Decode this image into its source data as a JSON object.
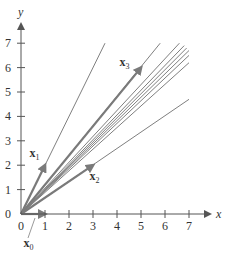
{
  "chart_data": {
    "type": "line",
    "title": "",
    "xlabel": "x",
    "ylabel": "y",
    "xlim": [
      0,
      7.5
    ],
    "ylim": [
      0,
      7.5
    ],
    "grid": false,
    "x_ticks": [
      0,
      1,
      2,
      3,
      4,
      5,
      6,
      7
    ],
    "y_ticks": [
      0,
      1,
      2,
      3,
      4,
      5,
      6,
      7
    ],
    "vectors": [
      {
        "name": "x0",
        "from": [
          0,
          0
        ],
        "to": [
          1,
          0
        ]
      },
      {
        "name": "x1",
        "from": [
          0,
          0
        ],
        "to": [
          1,
          2
        ]
      },
      {
        "name": "x2",
        "from": [
          0,
          0
        ],
        "to": [
          3,
          2
        ]
      },
      {
        "name": "x3",
        "from": [
          0,
          0
        ],
        "to": [
          5,
          6
        ]
      }
    ],
    "rays": [
      {
        "to": [
          3.5,
          7.0
        ]
      },
      {
        "to": [
          5.8,
          7.0
        ]
      },
      {
        "to": [
          6.6,
          7.0
        ]
      },
      {
        "to": [
          6.8,
          6.9
        ]
      },
      {
        "to": [
          6.9,
          6.8
        ]
      },
      {
        "to": [
          7.0,
          6.7
        ]
      },
      {
        "to": [
          7.0,
          6.5
        ]
      },
      {
        "to": [
          7.0,
          6.2
        ]
      },
      {
        "to": [
          7.0,
          4.7
        ]
      }
    ],
    "labels": [
      {
        "text": "x",
        "sub": "0",
        "at": [
          0.1,
          -1.35
        ]
      },
      {
        "text": "x",
        "sub": "1",
        "at": [
          0.35,
          2.35
        ]
      },
      {
        "text": "x",
        "sub": "2",
        "at": [
          2.85,
          1.4
        ]
      },
      {
        "text": "x",
        "sub": "3",
        "at": [
          4.1,
          6.05
        ]
      }
    ]
  },
  "axes": {
    "x_label": "x",
    "y_label": "y",
    "x_tick_labels": [
      "0",
      "1",
      "2",
      "3",
      "4",
      "5",
      "6",
      "7"
    ],
    "y_tick_labels": [
      "0",
      "1",
      "2",
      "3",
      "4",
      "5",
      "6",
      "7"
    ]
  },
  "vector_labels": {
    "x0": {
      "main": "x",
      "sub": "0"
    },
    "x1": {
      "main": "x",
      "sub": "1"
    },
    "x2": {
      "main": "x",
      "sub": "2"
    },
    "x3": {
      "main": "x",
      "sub": "3"
    }
  },
  "colors": {
    "axis": "#555555",
    "vector": "#7a7a7a",
    "ray": "#7f7f7f",
    "text": "#333333"
  }
}
